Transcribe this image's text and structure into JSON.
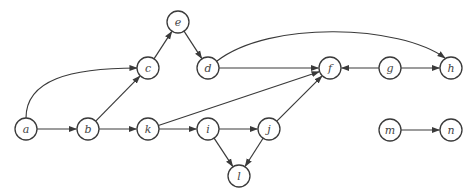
{
  "diagram": {
    "type": "directed-graph",
    "node_radius": 11,
    "colors": {
      "stroke": "#3a3a3a",
      "fill": "#ffffff",
      "label": "#444444"
    },
    "nodes": [
      {
        "id": "e",
        "label": "e",
        "x": 178,
        "y": 22
      },
      {
        "id": "c",
        "label": "c",
        "x": 148,
        "y": 68
      },
      {
        "id": "d",
        "label": "d",
        "x": 208,
        "y": 68
      },
      {
        "id": "f",
        "label": "f",
        "x": 330,
        "y": 68
      },
      {
        "id": "g",
        "label": "g",
        "x": 390,
        "y": 68
      },
      {
        "id": "h",
        "label": "h",
        "x": 451,
        "y": 68
      },
      {
        "id": "a",
        "label": "a",
        "x": 26,
        "y": 129
      },
      {
        "id": "b",
        "label": "b",
        "x": 88,
        "y": 129
      },
      {
        "id": "k",
        "label": "k",
        "x": 148,
        "y": 129
      },
      {
        "id": "i",
        "label": "i",
        "x": 208,
        "y": 129
      },
      {
        "id": "j",
        "label": "j",
        "x": 269,
        "y": 129
      },
      {
        "id": "l",
        "label": "l",
        "x": 239,
        "y": 176
      },
      {
        "id": "m",
        "label": "m",
        "x": 390,
        "y": 130
      },
      {
        "id": "n",
        "label": "n",
        "x": 451,
        "y": 130
      }
    ],
    "edges": [
      {
        "from": "a",
        "to": "c",
        "curve": "M26,118 C26,80 70,68 137,68"
      },
      {
        "from": "a",
        "to": "b"
      },
      {
        "from": "b",
        "to": "c"
      },
      {
        "from": "b",
        "to": "k"
      },
      {
        "from": "c",
        "to": "e"
      },
      {
        "from": "e",
        "to": "d"
      },
      {
        "from": "d",
        "to": "f"
      },
      {
        "from": "d",
        "to": "h",
        "curve": "M217,61 C270,20 400,25 445,58"
      },
      {
        "from": "k",
        "to": "f"
      },
      {
        "from": "k",
        "to": "i"
      },
      {
        "from": "i",
        "to": "j"
      },
      {
        "from": "i",
        "to": "l"
      },
      {
        "from": "j",
        "to": "f"
      },
      {
        "from": "j",
        "to": "l"
      },
      {
        "from": "g",
        "to": "f"
      },
      {
        "from": "g",
        "to": "h"
      },
      {
        "from": "m",
        "to": "n"
      }
    ]
  }
}
